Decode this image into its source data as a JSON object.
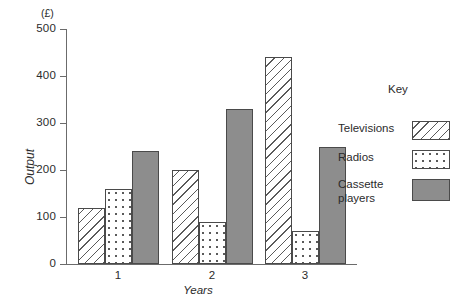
{
  "chart_data": {
    "type": "bar",
    "title": "",
    "xlabel": "Years",
    "ylabel": "Output",
    "unit_label": "(£)",
    "categories": [
      "1",
      "2",
      "3"
    ],
    "series": [
      {
        "name": "Televisions",
        "values": [
          120,
          200,
          440
        ],
        "fill": "diagonal-hatch",
        "color": "#ffffff"
      },
      {
        "name": "Radios",
        "values": [
          160,
          90,
          70
        ],
        "fill": "dotted",
        "color": "#ffffff"
      },
      {
        "name": "Cassette players",
        "values": [
          240,
          330,
          250
        ],
        "fill": "solid",
        "color": "#8d8d8d"
      }
    ],
    "ylim": [
      0,
      500
    ],
    "yticks": [
      0,
      100,
      200,
      300,
      400,
      500
    ],
    "ytick_labels": [
      "0",
      "100",
      "200",
      "300",
      "400",
      "500"
    ],
    "grid": false,
    "legend_position": "right",
    "legend_title": "Key"
  },
  "axis": {
    "unit": "(£)",
    "y_title": "Output",
    "x_title": "Years",
    "ticks": [
      {
        "label": "500"
      },
      {
        "label": "400"
      },
      {
        "label": "300"
      },
      {
        "label": "200"
      },
      {
        "label": "100"
      },
      {
        "label": "0"
      }
    ],
    "x_labels": [
      "1",
      "2",
      "3"
    ]
  },
  "legend": {
    "title": "Key",
    "items": [
      {
        "label": "Televisions"
      },
      {
        "label": "Radios"
      },
      {
        "label": "Cassette\nplayers",
        "line1": "Cassette",
        "line2": "players"
      }
    ]
  }
}
